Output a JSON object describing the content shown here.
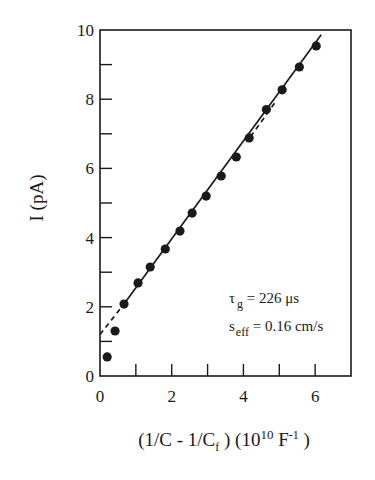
{
  "chart_data": {
    "type": "scatter",
    "title": "",
    "xlabel": "(1/C - 1/C_f) (10^10 F^-1)",
    "xlabel_parts": {
      "open": "(1/C - 1/C",
      "sub": "f",
      "mid": " ) (10",
      "sup1": "10",
      "unit": " F",
      "sup2": "-1",
      "close": "  )"
    },
    "ylabel": "I (pA)",
    "xlim": [
      0,
      7
    ],
    "ylim": [
      0,
      10
    ],
    "x_ticks": [
      0,
      1,
      2,
      3,
      4,
      5,
      6,
      7
    ],
    "x_tick_labels": [
      "0",
      "",
      "2",
      "",
      "4",
      "",
      "6",
      ""
    ],
    "y_ticks": [
      0,
      1,
      2,
      3,
      4,
      5,
      6,
      7,
      8,
      9,
      10
    ],
    "y_tick_labels": [
      "0",
      "",
      "2",
      "",
      "4",
      "",
      "6",
      "",
      "8",
      "",
      "10"
    ],
    "grid": false,
    "legend": null,
    "series": [
      {
        "name": "measured current",
        "style": "filled circles",
        "x": [
          0.2,
          0.42,
          0.67,
          1.06,
          1.4,
          1.82,
          2.23,
          2.57,
          2.96,
          3.38,
          3.8,
          4.16,
          4.64,
          5.08,
          5.56,
          6.03
        ],
        "y": [
          0.55,
          1.3,
          2.08,
          2.69,
          3.15,
          3.67,
          4.19,
          4.71,
          5.2,
          5.78,
          6.33,
          6.88,
          7.7,
          8.27,
          8.93,
          9.54
        ]
      },
      {
        "name": "linear fit (solid)",
        "style": "solid line",
        "x": [
          0.67,
          6.17
        ],
        "y": [
          2.08,
          9.86
        ]
      },
      {
        "name": "extrapolation (dashed)",
        "style": "dashed line",
        "x": [
          0.0,
          0.67
        ],
        "y": [
          1.2,
          2.08
        ]
      },
      {
        "name": "upper deviation (dashed)",
        "style": "dashed line",
        "x": [
          4.2,
          4.9
        ],
        "y": [
          6.92,
          7.93
        ]
      }
    ],
    "annotations": [
      {
        "text": "τ_g = 226 μs",
        "symbol": "τ",
        "sub": "g",
        "value": " = 226 μs",
        "x": 3.5,
        "y": 2.2
      },
      {
        "text": "s_eff = 0.16 cm/s",
        "symbol": "s",
        "sub": "eff",
        "value": " = 0.16 cm/s",
        "x": 3.5,
        "y": 1.3
      }
    ]
  }
}
